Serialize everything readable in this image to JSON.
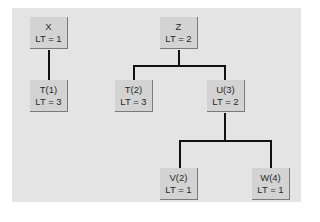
{
  "diagram": {
    "type": "tree",
    "colors": {
      "background_panel": "#e4e4e4",
      "node_fill": "#d3d3d3",
      "node_shadow": "#7a7a7a",
      "edge": "#111111"
    },
    "nodes": [
      {
        "id": "X",
        "name": "X",
        "lt": "LT = 1"
      },
      {
        "id": "T1",
        "name": "T(1)",
        "lt": "LT = 3"
      },
      {
        "id": "Z",
        "name": "Z",
        "lt": "LT = 2"
      },
      {
        "id": "T2",
        "name": "T(2)",
        "lt": "LT = 3"
      },
      {
        "id": "U3",
        "name": "U(3)",
        "lt": "LT = 2"
      },
      {
        "id": "V2",
        "name": "V(2)",
        "lt": "LT = 1"
      },
      {
        "id": "W4",
        "name": "W(4)",
        "lt": "LT = 1"
      }
    ],
    "edges": [
      [
        "X",
        "T1"
      ],
      [
        "Z",
        "T2"
      ],
      [
        "Z",
        "U3"
      ],
      [
        "U3",
        "V2"
      ],
      [
        "U3",
        "W4"
      ]
    ]
  }
}
